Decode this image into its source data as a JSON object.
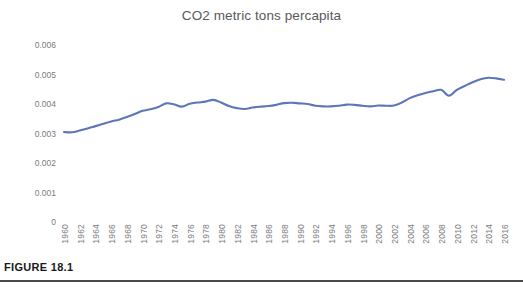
{
  "figure": {
    "caption": "FIGURE 18.1",
    "rule_color": "#4a4a4a"
  },
  "chart_data": {
    "type": "line",
    "title": "CO2 metric tons percapita",
    "xlabel": "",
    "ylabel": "",
    "ylim": [
      0,
      0.006
    ],
    "xlim": [
      1960,
      2016
    ],
    "grid": false,
    "legend": false,
    "legend_position": "none",
    "line_color": "#5c76b9",
    "y_ticks": [
      "0.006",
      "0.005",
      "0.004",
      "0.003",
      "0.002",
      "0.001",
      "0"
    ],
    "y_tick_values": [
      0.006,
      0.005,
      0.004,
      0.003,
      0.002,
      0.001,
      0
    ],
    "x_tick_labels": [
      "1960",
      "1962",
      "1964",
      "1966",
      "1968",
      "1970",
      "1972",
      "1974",
      "1976",
      "1978",
      "1980",
      "1982",
      "1984",
      "1986",
      "1988",
      "1990",
      "1992",
      "1994",
      "1996",
      "1998",
      "2000",
      "2002",
      "2004",
      "2006",
      "2008",
      "2010",
      "2012",
      "2014",
      "2016"
    ],
    "x": [
      1960,
      1961,
      1962,
      1963,
      1964,
      1965,
      1966,
      1967,
      1968,
      1969,
      1970,
      1971,
      1972,
      1973,
      1974,
      1975,
      1976,
      1977,
      1978,
      1979,
      1980,
      1981,
      1982,
      1983,
      1984,
      1985,
      1986,
      1987,
      1988,
      1989,
      1990,
      1991,
      1992,
      1993,
      1994,
      1995,
      1996,
      1997,
      1998,
      1999,
      2000,
      2001,
      2002,
      2003,
      2004,
      2005,
      2006,
      2007,
      2008,
      2009,
      2010,
      2011,
      2012,
      2013,
      2014,
      2015,
      2016
    ],
    "series": [
      {
        "name": "CO2 metric tons per capita",
        "values": [
          0.00305,
          0.00304,
          0.0031,
          0.00317,
          0.00325,
          0.00333,
          0.00341,
          0.00347,
          0.00356,
          0.00366,
          0.00377,
          0.00382,
          0.0039,
          0.00402,
          0.00399,
          0.00391,
          0.00401,
          0.00405,
          0.00408,
          0.00414,
          0.00405,
          0.00393,
          0.00386,
          0.00383,
          0.00388,
          0.00391,
          0.00393,
          0.00397,
          0.00403,
          0.00404,
          0.00402,
          0.004,
          0.00394,
          0.00392,
          0.00392,
          0.00394,
          0.00398,
          0.00397,
          0.00394,
          0.00392,
          0.00395,
          0.00394,
          0.00395,
          0.00405,
          0.0042,
          0.0043,
          0.00437,
          0.00443,
          0.00448,
          0.00428,
          0.00448,
          0.00461,
          0.00474,
          0.00484,
          0.00489,
          0.00487,
          0.00482
        ]
      }
    ]
  }
}
